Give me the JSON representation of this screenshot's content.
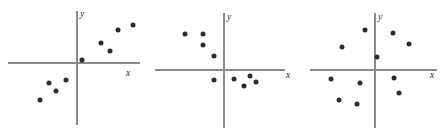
{
  "figure": {
    "width": 445,
    "height": 137,
    "background": "#ffffff",
    "point_color": "#2b2b2b",
    "axis_color": "#8a8a8a",
    "panel_count": 3
  },
  "chart_data": [
    {
      "type": "scatter",
      "title": "",
      "xlabel": "x",
      "ylabel": "y",
      "panel_index": 1,
      "description": "positive linear association",
      "origin_px": [
        77,
        63
      ],
      "x_axis_px": [
        8,
        140
      ],
      "y_axis_px": [
        11,
        125
      ],
      "xlim": [
        -69,
        63
      ],
      "ylim": [
        -62,
        52
      ],
      "grid": false,
      "legend": "none",
      "points_px": [
        [
          40,
          100
        ],
        [
          56,
          91
        ],
        [
          49,
          83
        ],
        [
          66,
          80
        ],
        [
          82,
          60
        ],
        [
          101,
          43
        ],
        [
          110,
          51
        ],
        [
          118,
          30
        ],
        [
          133,
          25
        ]
      ],
      "points": [
        [
          -37,
          -37
        ],
        [
          -21,
          -28
        ],
        [
          -28,
          -20
        ],
        [
          -11,
          -17
        ],
        [
          5,
          3
        ],
        [
          24,
          20
        ],
        [
          33,
          12
        ],
        [
          41,
          33
        ],
        [
          56,
          38
        ]
      ]
    },
    {
      "type": "scatter",
      "title": "",
      "xlabel": "x",
      "ylabel": "y",
      "panel_index": 2,
      "description": "negative curved association",
      "origin_px": [
        224,
        70
      ],
      "x_axis_px": [
        155,
        285
      ],
      "y_axis_px": [
        13,
        128
      ],
      "xlim": [
        -69,
        61
      ],
      "ylim": [
        -58,
        57
      ],
      "grid": false,
      "legend": "none",
      "points_px": [
        [
          185,
          34
        ],
        [
          203,
          34
        ],
        [
          203,
          45
        ],
        [
          214,
          56
        ],
        [
          214,
          80
        ],
        [
          234,
          79
        ],
        [
          244,
          86
        ],
        [
          250,
          76
        ],
        [
          256,
          82
        ]
      ],
      "points": [
        [
          -39,
          36
        ],
        [
          -21,
          36
        ],
        [
          -21,
          25
        ],
        [
          -10,
          14
        ],
        [
          -10,
          -10
        ],
        [
          10,
          -9
        ],
        [
          20,
          -16
        ],
        [
          26,
          -6
        ],
        [
          32,
          -12
        ]
      ]
    },
    {
      "type": "scatter",
      "title": "",
      "xlabel": "x",
      "ylabel": "y",
      "panel_index": 3,
      "description": "no association, circular scatter",
      "origin_px": [
        375,
        70
      ],
      "x_axis_px": [
        310,
        437
      ],
      "y_axis_px": [
        13,
        128
      ],
      "xlim": [
        -65,
        62
      ],
      "ylim": [
        -58,
        57
      ],
      "grid": false,
      "legend": "none",
      "points_px": [
        [
          393,
          33
        ],
        [
          365,
          30
        ],
        [
          342,
          47
        ],
        [
          377,
          57
        ],
        [
          409,
          44
        ],
        [
          331,
          79
        ],
        [
          360,
          83
        ],
        [
          394,
          78
        ],
        [
          399,
          93
        ],
        [
          339,
          100
        ],
        [
          357,
          104
        ]
      ],
      "points": [
        [
          18,
          37
        ],
        [
          -10,
          40
        ],
        [
          -33,
          23
        ],
        [
          2,
          13
        ],
        [
          34,
          26
        ],
        [
          -44,
          -9
        ],
        [
          -15,
          -13
        ],
        [
          19,
          -8
        ],
        [
          24,
          -23
        ],
        [
          -36,
          -30
        ],
        [
          -18,
          -34
        ]
      ]
    }
  ]
}
